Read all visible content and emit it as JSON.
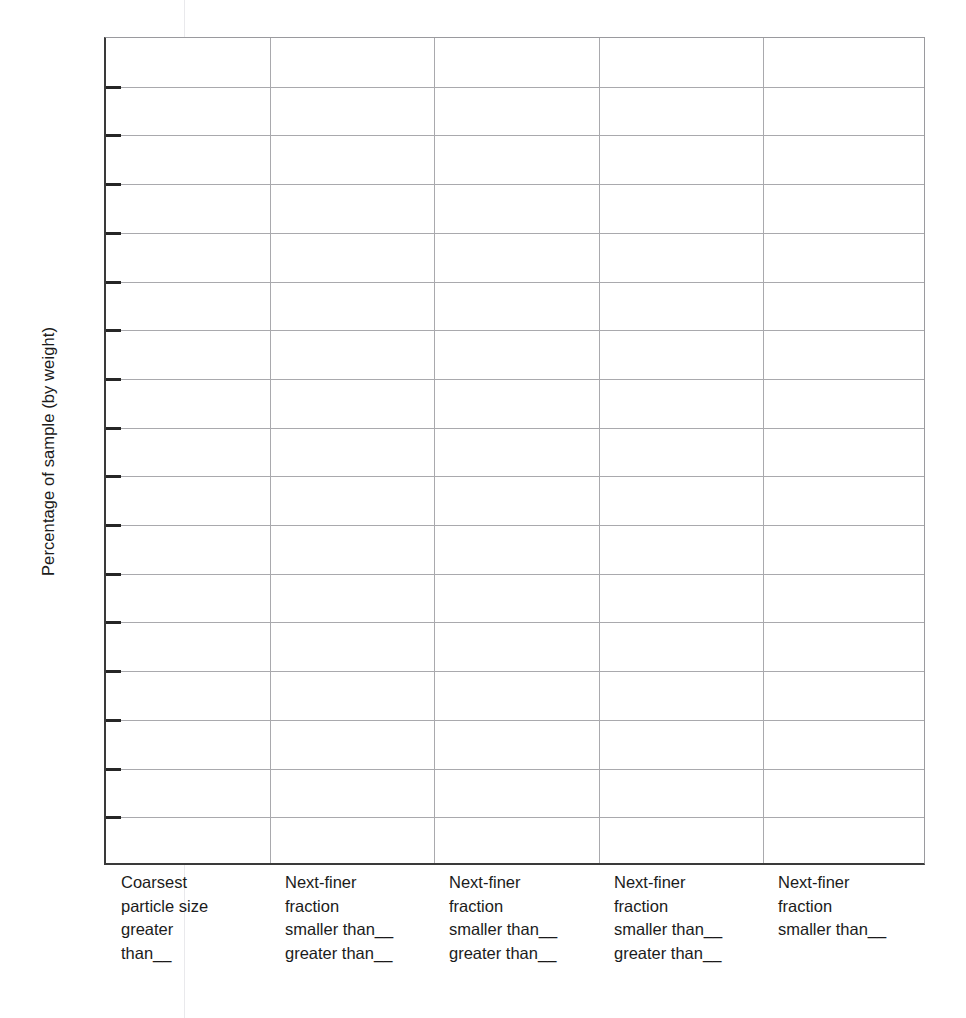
{
  "figure": {
    "type": "blank-grid-worksheet",
    "y_axis": {
      "title": "Percentage of sample (by weight)",
      "tick_count": 16,
      "tick_labels": [],
      "gridlines": true
    },
    "x_axis": {
      "gridlines": true,
      "category_count": 5,
      "categories": [
        {
          "id": "coarsest-fraction",
          "lines": [
            "Coarsest",
            "particle size",
            "greater",
            "than__"
          ]
        },
        {
          "id": "next-finer-1",
          "lines": [
            "Next-finer",
            "fraction",
            "smaller than__",
            "greater than__"
          ]
        },
        {
          "id": "next-finer-2",
          "lines": [
            "Next-finer",
            "fraction",
            "smaller than__",
            "greater than__"
          ]
        },
        {
          "id": "next-finer-3",
          "lines": [
            "Next-finer",
            "fraction",
            "smaller than__",
            "greater than__"
          ]
        },
        {
          "id": "next-finer-4",
          "lines": [
            "Next-finer",
            "fraction",
            "smaller than__"
          ]
        }
      ]
    },
    "colors": {
      "ink": "#1b1b1b",
      "axis": "#3a3a3a",
      "gridline": "#a9a9ad",
      "background": "#ffffff",
      "artifact": "#e9e9ec"
    }
  },
  "chart_data": {
    "type": "bar",
    "title": "",
    "subtitle": "",
    "xlabel": "",
    "ylabel": "Percentage of sample (by weight)",
    "categories": [
      "Coarsest particle size greater than__",
      "Next-finer fraction smaller than__ greater than__",
      "Next-finer fraction smaller than__ greater than__",
      "Next-finer fraction smaller than__ greater than__",
      "Next-finer fraction smaller than__"
    ],
    "values": [
      null,
      null,
      null,
      null,
      null
    ],
    "series": [],
    "ylim": [
      null,
      null
    ],
    "ytick_labels": [],
    "ytick_count": 16,
    "grid": true,
    "legend": null,
    "annotations": [],
    "note": "Blank data-entry grid: no bars, data labels, or numeric tick values are printed on the figure."
  }
}
